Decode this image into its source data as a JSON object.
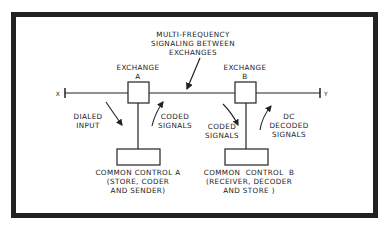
{
  "diagram": {
    "title_label": "MULTI-FREQUENCY\nSIGNALING BETWEEN\nEXCHANGES",
    "exchange_a": {
      "label": "EXCHANGE\nA"
    },
    "exchange_b": {
      "label": "EXCHANGE\nB"
    },
    "endpoint_x": "X",
    "endpoint_y": "Y",
    "signals": {
      "dialed_input": "DIALED\nINPUT",
      "coded_signals_a": "CODED\nSIGNALS",
      "coded_signals_b": "CODED\nSIGNALS",
      "dc_decoded_signals": "DC\nDECODED\nSIGNALS"
    },
    "common_control_a": {
      "label": "COMMON CONTROL A\n(STORE, CODER\nAND SENDER)"
    },
    "common_control_b": {
      "label": "COMMON  CONTROL  B\n(RECEIVER, DECODER\nAND STORE )"
    },
    "colors": {
      "line": "#222222",
      "background": "#ffffff"
    }
  }
}
